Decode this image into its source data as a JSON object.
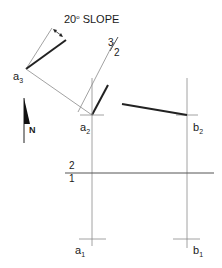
{
  "diagram": {
    "slope_label_main": "20",
    "slope_label_deg": "o",
    "slope_label_word": " SLOPE",
    "ratio_label": {
      "top": "3",
      "bottom": "2"
    },
    "fold_line_label": {
      "top": "2",
      "bottom": "1"
    },
    "north_label": "N",
    "points": {
      "a3": {
        "base": "a",
        "sub": "3"
      },
      "a2": {
        "base": "a",
        "sub": "2"
      },
      "b2": {
        "base": "b",
        "sub": "2"
      },
      "a1": {
        "base": "a",
        "sub": "1"
      },
      "b1": {
        "base": "b",
        "sub": "1"
      }
    },
    "colors": {
      "thick_line": "#222222",
      "thin_line": "#8a8a8a",
      "text": "#1a1a1a"
    }
  }
}
